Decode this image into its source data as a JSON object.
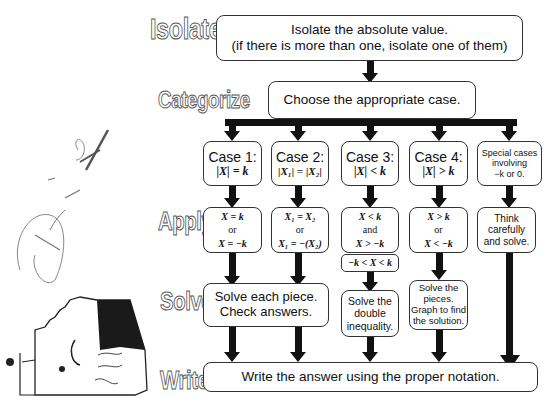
{
  "stages": {
    "isolate": "Isolate",
    "categorize": "Categorize",
    "apply": "Apply",
    "solve": "Solve",
    "write": "Write"
  },
  "isolate_box": {
    "line1": "Isolate the absolute value.",
    "line2": "(if there is more than one, isolate one of them)"
  },
  "categorize_box": {
    "text": "Choose the appropriate case."
  },
  "cases": [
    {
      "title": "Case 1:",
      "formula": "|X| = k"
    },
    {
      "title": "Case 2:",
      "formula": "|X₁| = |X₂|"
    },
    {
      "title": "Case 3:",
      "formula": "|X| < k"
    },
    {
      "title": "Case 4:",
      "formula": "|X| > k"
    },
    {
      "title_lines": [
        "Special cases",
        "involving",
        "−k or 0."
      ]
    }
  ],
  "apply": [
    {
      "line1": "X = k",
      "or": "or",
      "line2": "X = −k"
    },
    {
      "line1": "X₁ = X₂",
      "or": "or",
      "line2": "X₁ = −(X₂)"
    },
    {
      "line1": "X < k",
      "or": "and",
      "line2": "X > −k",
      "combined": "−k < X < k"
    },
    {
      "line1": "X > k",
      "or": "or",
      "line2": "X < −k"
    },
    {
      "lines": [
        "Think",
        "carefully",
        "and solve."
      ]
    }
  ],
  "solve": {
    "cases_1_2": [
      "Solve each piece.",
      "Check answers."
    ],
    "case_3": [
      "Solve the",
      "double",
      "inequality."
    ],
    "case_4": [
      "Solve the",
      "pieces.",
      "Graph to find",
      "the solution."
    ]
  },
  "write_box": {
    "text": "Write the answer using the proper notation."
  },
  "handwriting": {
    "text": "Quiz"
  },
  "colors": {
    "arrow": "#111111",
    "border": "#333333",
    "background": "#ffffff"
  }
}
